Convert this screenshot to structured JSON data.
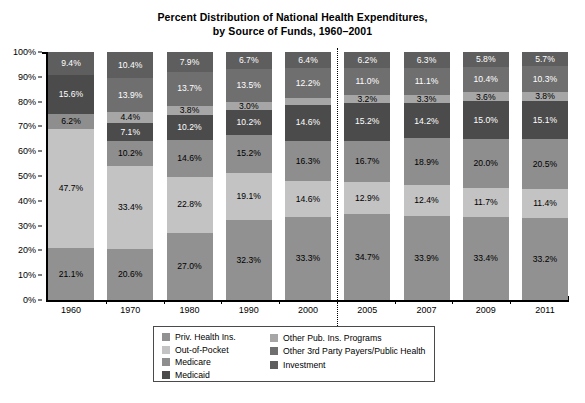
{
  "chart_data": {
    "type": "bar",
    "subtype": "stacked-bar-100",
    "title": "Percent Distribution of National Health Expenditures, by Source of Funds, 1960–2001",
    "title_lines": [
      "Percent Distribution of National Health Expenditures,",
      "by Source of Funds, 1960–2001"
    ],
    "xlabel": "",
    "ylabel": "",
    "ylim": [
      0,
      100
    ],
    "ytick_labels": [
      "100%",
      "90%",
      "80%",
      "70%",
      "60%",
      "50%",
      "40%",
      "30%",
      "20%",
      "10%",
      "0%"
    ],
    "ytick_values": [
      100,
      90,
      80,
      70,
      60,
      50,
      40,
      30,
      20,
      10,
      0
    ],
    "grid": false,
    "legend_position": "bottom-center",
    "categories": [
      "1960",
      "1970",
      "1980",
      "1990",
      "2000",
      "2005",
      "2007",
      "2009",
      "2011"
    ],
    "divider_after_category": "2000",
    "series": [
      {
        "name": "Priv. Health Ins.",
        "color": "#919191",
        "values": [
          21.1,
          20.6,
          27.0,
          32.3,
          33.3,
          34.7,
          33.9,
          33.4,
          33.2
        ]
      },
      {
        "name": "Out-of-Pocket",
        "color": "#c3c3c3",
        "values": [
          47.7,
          33.4,
          22.8,
          19.1,
          14.6,
          12.9,
          12.4,
          11.7,
          11.4
        ]
      },
      {
        "name": "Medicare",
        "color": "#8e8e8e",
        "values": [
          6.2,
          10.2,
          14.6,
          15.2,
          16.3,
          16.7,
          18.9,
          20.0,
          20.5
        ]
      },
      {
        "name": "Medicaid",
        "color": "#4b4b4b",
        "values": [
          15.6,
          7.1,
          10.2,
          10.2,
          14.6,
          15.2,
          14.2,
          15.0,
          15.1
        ]
      },
      {
        "name": "Other Pub. Ins. Programs",
        "color": "#a6a6a6",
        "values": [
          0.0,
          4.4,
          3.8,
          3.0,
          2.6,
          3.2,
          3.3,
          3.6,
          3.8
        ]
      },
      {
        "name": "Other 3rd Party Payers/Public Health",
        "color": "#6f6f6f",
        "values": [
          0.0,
          13.9,
          13.7,
          13.5,
          12.2,
          11.0,
          11.1,
          10.4,
          10.3
        ]
      },
      {
        "name": "Investment",
        "color": "#5e5e5e",
        "values": [
          9.4,
          10.4,
          7.9,
          6.7,
          6.4,
          6.2,
          6.3,
          5.8,
          5.7
        ]
      }
    ],
    "data_labels": {
      "1960": [
        "21.1%",
        "47.7%",
        "6.2%",
        "15.6%",
        "",
        "",
        "9.4%"
      ],
      "1970": [
        "20.6%",
        "33.4%",
        "10.2%",
        "7.1%",
        "4.4%",
        "13.9%",
        "10.4%"
      ],
      "1980": [
        "27.0%",
        "22.8%",
        "14.6%",
        "10.2%",
        "3.8%",
        "13.7%",
        "7.9%"
      ],
      "1990": [
        "32.3%",
        "19.1%",
        "15.2%",
        "10.2%",
        "3.0%",
        "13.5%",
        "6.7%"
      ],
      "2000": [
        "33.3%",
        "14.6%",
        "16.3%",
        "14.6%",
        "2.6%",
        "12.2%",
        "6.4%"
      ],
      "2005": [
        "34.7%",
        "12.9%",
        "16.7%",
        "15.2%",
        "3.2%",
        "11.0%",
        "6.2%"
      ],
      "2007": [
        "33.9%",
        "12.4%",
        "18.9%",
        "14.2%",
        "3.3%",
        "11.1%",
        "6.3%"
      ],
      "2009": [
        "33.4%",
        "11.7%",
        "20.0%",
        "15.0%",
        "3.6%",
        "10.4%",
        "5.8%"
      ],
      "2011": [
        "33.2%",
        "11.4%",
        "20.5%",
        "15.1%",
        "3.8%",
        "10.3%",
        "5.7%"
      ]
    }
  },
  "legend": {
    "column_1": [
      {
        "label": "Priv. Health Ins.",
        "color": "#919191"
      },
      {
        "label": "Out-of-Pocket",
        "color": "#c3c3c3"
      },
      {
        "label": "Medicare",
        "color": "#8e8e8e"
      },
      {
        "label": "Medicaid",
        "color": "#4b4b4b"
      }
    ],
    "column_2": [
      {
        "label": "Other Pub. Ins. Programs",
        "color": "#a6a6a6"
      },
      {
        "label": "Other 3rd Party Payers/Public Health",
        "color": "#6f6f6f"
      },
      {
        "label": "Investment",
        "color": "#5e5e5e"
      }
    ]
  }
}
